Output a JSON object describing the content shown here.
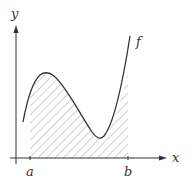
{
  "diagram": {
    "title": "",
    "labels": {
      "x_axis": "x",
      "y_axis": "y",
      "function": "f",
      "lower_bound": "a",
      "upper_bound": "b"
    },
    "colors": {
      "ink": "#333333",
      "hatch": "#8a8a8a",
      "background": "#ffffff"
    }
  }
}
